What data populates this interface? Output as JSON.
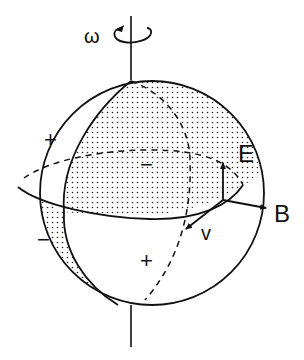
{
  "diagram": {
    "labels": {
      "omega": "ω",
      "E": "E",
      "B": "B",
      "v": "v",
      "plus_upper_left": "+",
      "minus_center": "−",
      "minus_lower_left": "−",
      "plus_lower_center": "+"
    },
    "colors": {
      "stroke": "#111111",
      "background": "#ffffff",
      "stipple": "#222222"
    }
  }
}
